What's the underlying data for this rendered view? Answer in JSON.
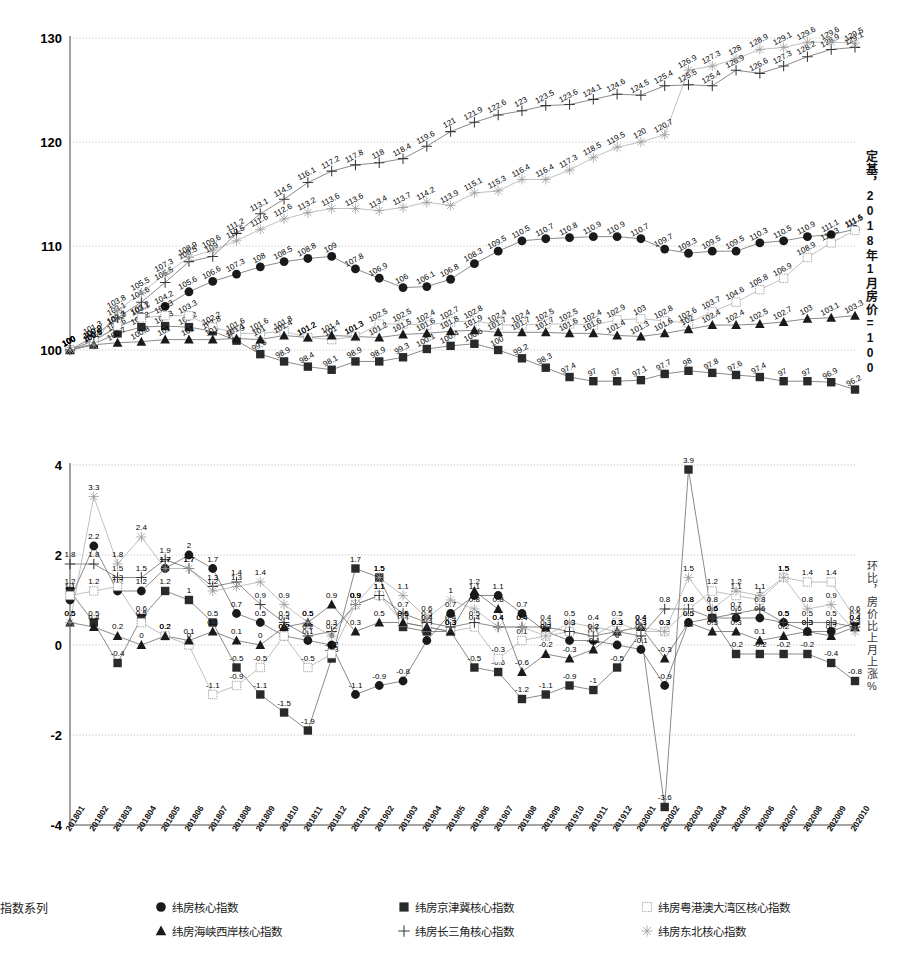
{
  "chart_data": [
    {
      "type": "line",
      "id": "index-base-chart",
      "title": "",
      "ylabel": "定基，2018年1月房价=100",
      "xlabel": "",
      "ylim": [
        100,
        130
      ],
      "yticks": [
        100,
        110,
        120,
        130
      ],
      "grid": true,
      "legend_position": "bottom",
      "categories": [
        "201801",
        "201802",
        "201803",
        "201804",
        "201805",
        "201806",
        "201807",
        "201808",
        "201809",
        "201810",
        "201811",
        "201812",
        "201901",
        "201902",
        "201903",
        "201904",
        "201905",
        "201906",
        "201907",
        "201908",
        "201909",
        "201910",
        "201911",
        "201912",
        "202001",
        "202002",
        "202003",
        "202004",
        "202005",
        "202006",
        "202007",
        "202008",
        "202009",
        "202010"
      ],
      "series": [
        {
          "name": "纬房核心指数",
          "marker": "circle",
          "values": [
            100,
            100.9,
            102.2,
            103.2,
            104.2,
            105.6,
            106.6,
            107.3,
            108,
            108.5,
            108.8,
            109,
            107.8,
            106.9,
            106,
            106.1,
            106.8,
            108.3,
            109.5,
            110.5,
            110.7,
            110.8,
            110.9,
            110.9,
            110.7,
            109.7,
            109.3,
            109.5,
            109.5,
            110.3,
            110.5,
            110.9,
            111.1,
            111.6
          ]
        },
        {
          "name": "纬房京津冀核心指数",
          "marker": "square",
          "values": [
            100,
            100.6,
            101.6,
            102.2,
            102.3,
            102.2,
            101.8,
            100.9,
            99.6,
            98.9,
            98.4,
            98.1,
            98.9,
            98.9,
            99.3,
            100.1,
            100.4,
            100.6,
            100,
            99.2,
            98.3,
            97.4,
            97,
            97,
            97.1,
            97.7,
            98,
            97.8,
            97.6,
            97.4,
            97,
            97,
            96.9,
            96.2
          ]
        },
        {
          "name": "纬房粤港澳大湾区核心指数",
          "marker": "square-open",
          "values": [
            100,
            100.9,
            102.3,
            103.1,
            103.3,
            103.3,
            102.2,
            101.6,
            101.6,
            101.8,
            101.2,
            101,
            101.3,
            102.5,
            102.5,
            102.4,
            102.7,
            102.8,
            102.4,
            102.4,
            102.5,
            102.5,
            102.4,
            102.9,
            103,
            102.8,
            102.6,
            103.7,
            104.6,
            105.8,
            106.9,
            108.9,
            110.3,
            111.5
          ]
        },
        {
          "name": "纬房海峡西岸核心指数",
          "marker": "triangle",
          "values": [
            100,
            100.5,
            100.7,
            100.8,
            101,
            101,
            101,
            101.1,
            101,
            101.4,
            101.2,
            101.4,
            101.3,
            101.2,
            101.5,
            101.6,
            101.8,
            101.9,
            101.7,
            101.7,
            101.7,
            101.6,
            101.6,
            101.4,
            101.3,
            101.6,
            102,
            102.4,
            102.4,
            102.5,
            102.7,
            103,
            103.1,
            103.3
          ]
        },
        {
          "name": "纬房长三角核心指数",
          "marker": "plus",
          "values": [
            100,
            101.3,
            103.1,
            104.6,
            106.5,
            108.5,
            109,
            111.2,
            113.1,
            114.5,
            116.1,
            117.2,
            117.8,
            118,
            118.4,
            119.6,
            121,
            121.9,
            122.6,
            123,
            123.5,
            123.6,
            124.1,
            124.6,
            124.5,
            125.4,
            125.5,
            125.4,
            126.9,
            126.6,
            127.3,
            128.2,
            128.9,
            129.1
          ]
        },
        {
          "name": "纬房东北核心指数",
          "marker": "star",
          "values": [
            100,
            100.5,
            103.8,
            105.5,
            107.3,
            108.9,
            109.6,
            110.5,
            111.6,
            112.6,
            113.2,
            113.6,
            113.6,
            113.4,
            113.7,
            114.2,
            113.9,
            115.1,
            115.3,
            116.4,
            116.4,
            117.3,
            118.5,
            119.5,
            120,
            120.7,
            126.9,
            127.3,
            128,
            128.9,
            129.1,
            129.6,
            129.6,
            129.5
          ]
        }
      ],
      "visible_point_labels": [
        "100",
        "100.9",
        "102.2",
        "103.2",
        "104.2",
        "105.6",
        "106.6",
        "107.3",
        "108",
        "108.5",
        "108.8",
        "109",
        "107.8",
        "106.9",
        "106",
        "106.1",
        "106.8",
        "108.3",
        "109.5",
        "110.5",
        "111.6",
        "112.6",
        "113.2",
        "113.6",
        "113.6",
        "113.4",
        "113.7",
        "114.2",
        "113.9",
        "115.1",
        "115.3",
        "116.4",
        "117.3",
        "118.5",
        "119.5",
        "120",
        "120.7",
        "121",
        "121.9",
        "122.6",
        "123",
        "123.5",
        "123.6",
        "124.1",
        "124.6",
        "124.5",
        "125.4",
        "125.5",
        "125.4",
        "126.9",
        "126.6",
        "127.3",
        "128.2",
        "128.9",
        "129.1",
        "129.6",
        "129.5",
        "111.2",
        "113.1",
        "114.5",
        "116.1",
        "117.2",
        "117.8",
        "118",
        "118.4",
        "119.6",
        "104.6",
        "105.1",
        "104.8",
        "103.2",
        "102.6",
        "101.8",
        "101.2",
        "101.1",
        "101.4",
        "100.6",
        "100.8",
        "100.4",
        "99.2",
        "98.4",
        "98.1",
        "98.9",
        "98.3",
        "97.4",
        "97",
        "96.9",
        "96.2",
        "103.7",
        "104.6",
        "105.8",
        "106.9",
        "108.9",
        "110.3",
        "111.5",
        "102.9",
        "103",
        "102.8",
        "102.6",
        "102.4",
        "102.5",
        "102.7",
        "103.1",
        "103.3",
        "108.2",
        "106.9",
        "106",
        "106.1",
        "106.8"
      ]
    },
    {
      "type": "line",
      "id": "mom-change-chart",
      "title": "",
      "ylabel": "环比，房价比上月上涨%",
      "xlabel": "",
      "ylim": [
        -4,
        4
      ],
      "yticks": [
        -4,
        -2,
        0,
        2,
        4
      ],
      "grid": true,
      "legend_position": "bottom",
      "categories": [
        "201801",
        "201802",
        "201803",
        "201804",
        "201805",
        "201806",
        "201807",
        "201808",
        "201809",
        "201810",
        "201811",
        "201812",
        "201901",
        "201902",
        "201903",
        "201904",
        "201905",
        "201906",
        "201907",
        "201908",
        "201909",
        "201910",
        "201911",
        "201912",
        "202001",
        "202002",
        "202003",
        "202004",
        "202005",
        "202006",
        "202007",
        "202008",
        "202009",
        "202010"
      ],
      "series": [
        {
          "name": "纬房核心指数",
          "marker": "circle",
          "values": [
            1,
            2.2,
            1.2,
            1.2,
            1.7,
            2,
            1.7,
            0.7,
            0.5,
            0.2,
            0.1,
            0,
            -1.1,
            -0.9,
            -0.8,
            0.1,
            0.7,
            1.1,
            1.1,
            0.7,
            0.3,
            0.1,
            0.1,
            0,
            -0.1,
            -0.9,
            0.5,
            0.6,
            0.6,
            0.6,
            0.5,
            0.3,
            0.3,
            0.5
          ]
        },
        {
          "name": "纬房京津冀核心指数",
          "marker": "square",
          "values": [
            1.2,
            0.5,
            -0.4,
            0.6,
            1.2,
            1,
            0.5,
            -0.5,
            -1.1,
            -1.5,
            -1.9,
            -0.3,
            1.7,
            1.5,
            0.4,
            0.3,
            0.3,
            -0.5,
            -0.6,
            -1.2,
            -1.1,
            -0.9,
            -1,
            -0.5,
            0.3,
            -3.6,
            3.9,
            0.6,
            -0.2,
            -0.2,
            -0.2,
            -0.2,
            -0.4,
            -0.8
          ]
        },
        {
          "name": "纬房粤港澳大湾区核心指数",
          "marker": "square-open",
          "values": [
            1.1,
            1.2,
            1.3,
            0.5,
            0.2,
            0,
            -1.1,
            -0.9,
            -0.5,
            0.2,
            -0.5,
            -0.2,
            0.9,
            1.1,
            0.5,
            0.4,
            0.3,
            0.4,
            -0.3,
            0.1,
            0.2,
            0.3,
            0.2,
            0.5,
            0.3,
            0.3,
            0.8,
            1.2,
            1.1,
            1,
            1.5,
            1.4,
            1.4,
            0.6
          ]
        },
        {
          "name": "纬房海峡西岸核心指数",
          "marker": "triangle",
          "values": [
            0.5,
            0.4,
            0.2,
            0,
            0.2,
            0.1,
            0.3,
            0.1,
            0,
            0.4,
            0.5,
            0.9,
            0.3,
            0.5,
            0.5,
            0.4,
            0.3,
            1.2,
            0.8,
            -0.6,
            -0.2,
            -0.3,
            -0.1,
            0.3,
            0.4,
            -0.3,
            0.5,
            0.3,
            0.3,
            0.1,
            0.2,
            0.3,
            0.2,
            0.4
          ]
        },
        {
          "name": "纬房长三角核心指数",
          "marker": "plus",
          "values": [
            1.8,
            1.8,
            1.5,
            1.5,
            1.9,
            1.7,
            1.3,
            1.4,
            0.9,
            0.5,
            0.2,
            0.3,
            0.9,
            1.1,
            0.7,
            0.5,
            0.4,
            0.5,
            0.4,
            0.4,
            0.4,
            0.3,
            0.2,
            0.3,
            0.2,
            0.8,
            0.8,
            0.6,
            0.7,
            0.8,
            0.5,
            0.5,
            0.5,
            0.4
          ]
        },
        {
          "name": "纬房东北核心指数",
          "marker": "star",
          "values": [
            0.5,
            3.3,
            1.8,
            2.4,
            1.7,
            1.7,
            1.2,
            1.3,
            1.4,
            0.9,
            0.5,
            0.2,
            0.9,
            1.5,
            1.1,
            0.6,
            1,
            0.8,
            0.4,
            0.4,
            0.2,
            0.5,
            0.4,
            0.3,
            0.4,
            0.3,
            1.5,
            0.8,
            1.2,
            1.1,
            1.5,
            0.8,
            0.9,
            0.3
          ]
        }
      ],
      "visible_point_labels": [
        "3.3",
        "2.2",
        "2.4",
        "2",
        "1.8",
        "1.7",
        "1.7",
        "1.5",
        "1.2",
        "1.3",
        "1.4",
        "0.9",
        "0.5",
        "1",
        "1.1",
        "0.2",
        "0.3",
        "1.7",
        "1.5",
        "0.7",
        "1.1",
        "1.2",
        "0.8",
        "0.4",
        "-0.5",
        "-0.6",
        "-1.2",
        "-1.1",
        "-0.9",
        "-1",
        "-0.5",
        "3.9",
        "-3.6",
        "1.5",
        "0.6",
        "0.3",
        "0.2",
        "1.4",
        "-0.4",
        "-0.8",
        "0.6",
        "-0.2",
        "-1.1",
        "-1.5",
        "-1.9",
        "-3.4",
        "-0.8",
        "0.1",
        "0.4"
      ]
    }
  ],
  "legend": {
    "title": "指数系列",
    "entries": [
      {
        "label": "纬房核心指数",
        "marker": "circle"
      },
      {
        "label": "纬房京津冀核心指数",
        "marker": "square"
      },
      {
        "label": "纬房粤港澳大湾区核心指数",
        "marker": "square-open"
      },
      {
        "label": "纬房海峡西岸核心指数",
        "marker": "triangle"
      },
      {
        "label": "纬房长三角核心指数",
        "marker": "plus"
      },
      {
        "label": "纬房东北核心指数",
        "marker": "star"
      }
    ]
  },
  "top_axis": {
    "yticks": [
      "130",
      "120",
      "110",
      "100"
    ],
    "caption": "定基，2018年1月房价=100"
  },
  "bottom_axis": {
    "yticks": [
      "4",
      "2",
      "0",
      "-2",
      "-4"
    ],
    "caption": "环比，房价比上月上涨%",
    "categories": [
      "201801",
      "201802",
      "201803",
      "201804",
      "201805",
      "201806",
      "201807",
      "201808",
      "201809",
      "201810",
      "201811",
      "201812",
      "201901",
      "201902",
      "201903",
      "201904",
      "201905",
      "201906",
      "201907",
      "201908",
      "201909",
      "201910",
      "201911",
      "201912",
      "202001",
      "202002",
      "202003",
      "202004",
      "202005",
      "202006",
      "202007",
      "202008",
      "202009",
      "202010"
    ]
  },
  "colors": {
    "ink": "#222222",
    "line": "#4a4a4a",
    "grid": "#9a9a9a",
    "axis": "#555555"
  }
}
